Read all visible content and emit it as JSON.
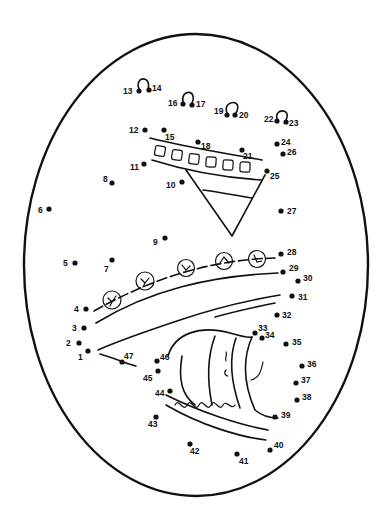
{
  "puzzle": {
    "type": "connect-the-dots",
    "subject": "decorated egg",
    "outline_color": "#111111",
    "background": "#ffffff",
    "total_dots": 47,
    "dots": [
      {
        "n": "1",
        "x": 88,
        "y": 351,
        "lx": 78,
        "ly": 360
      },
      {
        "n": "2",
        "x": 79,
        "y": 343,
        "lx": 66,
        "ly": 346
      },
      {
        "n": "3",
        "x": 84,
        "y": 328,
        "lx": 72,
        "ly": 331
      },
      {
        "n": "4",
        "x": 86,
        "y": 309,
        "lx": 74,
        "ly": 312
      },
      {
        "n": "5",
        "x": 75,
        "y": 263,
        "lx": 63,
        "ly": 266
      },
      {
        "n": "6",
        "x": 49,
        "y": 209,
        "lx": 38,
        "ly": 213
      },
      {
        "n": "7",
        "x": 112,
        "y": 260,
        "lx": 104,
        "ly": 272
      },
      {
        "n": "8",
        "x": 112,
        "y": 183,
        "lx": 103,
        "ly": 182
      },
      {
        "n": "9",
        "x": 165,
        "y": 238,
        "lx": 153,
        "ly": 245
      },
      {
        "n": "10",
        "x": 182,
        "y": 182,
        "lx": 166,
        "ly": 188
      },
      {
        "n": "11",
        "x": 144,
        "y": 164,
        "lx": 130,
        "ly": 170
      },
      {
        "n": "12",
        "x": 145,
        "y": 130,
        "lx": 129,
        "ly": 133
      },
      {
        "n": "13",
        "x": 139,
        "y": 91,
        "lx": 123,
        "ly": 94
      },
      {
        "n": "14",
        "x": 149,
        "y": 90,
        "lx": 152,
        "ly": 91
      },
      {
        "n": "15",
        "x": 164,
        "y": 130,
        "lx": 165,
        "ly": 140
      },
      {
        "n": "16",
        "x": 183,
        "y": 104,
        "lx": 168,
        "ly": 106
      },
      {
        "n": "17",
        "x": 192,
        "y": 105,
        "lx": 196,
        "ly": 107
      },
      {
        "n": "18",
        "x": 198,
        "y": 142,
        "lx": 201,
        "ly": 149
      },
      {
        "n": "19",
        "x": 227,
        "y": 115,
        "lx": 214,
        "ly": 114
      },
      {
        "n": "20",
        "x": 235,
        "y": 115,
        "lx": 239,
        "ly": 118
      },
      {
        "n": "21",
        "x": 242,
        "y": 150,
        "lx": 243,
        "ly": 159
      },
      {
        "n": "22",
        "x": 277,
        "y": 121,
        "lx": 264,
        "ly": 122
      },
      {
        "n": "23",
        "x": 286,
        "y": 122,
        "lx": 289,
        "ly": 126
      },
      {
        "n": "24",
        "x": 277,
        "y": 144,
        "lx": 281,
        "ly": 145
      },
      {
        "n": "25",
        "x": 267,
        "y": 171,
        "lx": 270,
        "ly": 179
      },
      {
        "n": "26",
        "x": 283,
        "y": 154,
        "lx": 287,
        "ly": 155
      },
      {
        "n": "27",
        "x": 281,
        "y": 211,
        "lx": 287,
        "ly": 214
      },
      {
        "n": "28",
        "x": 281,
        "y": 254,
        "lx": 287,
        "ly": 255
      },
      {
        "n": "29",
        "x": 283,
        "y": 272,
        "lx": 289,
        "ly": 271
      },
      {
        "n": "30",
        "x": 298,
        "y": 281,
        "lx": 303,
        "ly": 281
      },
      {
        "n": "31",
        "x": 292,
        "y": 296,
        "lx": 298,
        "ly": 300
      },
      {
        "n": "32",
        "x": 277,
        "y": 315,
        "lx": 282,
        "ly": 318
      },
      {
        "n": "33",
        "x": 255,
        "y": 333,
        "lx": 258,
        "ly": 331
      },
      {
        "n": "34",
        "x": 262,
        "y": 338,
        "lx": 265,
        "ly": 338
      },
      {
        "n": "35",
        "x": 286,
        "y": 344,
        "lx": 292,
        "ly": 345
      },
      {
        "n": "36",
        "x": 302,
        "y": 366,
        "lx": 307,
        "ly": 367
      },
      {
        "n": "37",
        "x": 296,
        "y": 383,
        "lx": 301,
        "ly": 383
      },
      {
        "n": "38",
        "x": 297,
        "y": 400,
        "lx": 302,
        "ly": 400
      },
      {
        "n": "39",
        "x": 275,
        "y": 417,
        "lx": 281,
        "ly": 418
      },
      {
        "n": "40",
        "x": 270,
        "y": 450,
        "lx": 274,
        "ly": 448
      },
      {
        "n": "41",
        "x": 237,
        "y": 454,
        "lx": 239,
        "ly": 464
      },
      {
        "n": "42",
        "x": 190,
        "y": 444,
        "lx": 190,
        "ly": 454
      },
      {
        "n": "43",
        "x": 156,
        "y": 417,
        "lx": 148,
        "ly": 427
      },
      {
        "n": "44",
        "x": 170,
        "y": 391,
        "lx": 155,
        "ly": 396
      },
      {
        "n": "45",
        "x": 158,
        "y": 371,
        "lx": 143,
        "ly": 381
      },
      {
        "n": "46",
        "x": 157,
        "y": 361,
        "lx": 160,
        "ly": 360
      },
      {
        "n": "47",
        "x": 122,
        "y": 362,
        "lx": 124,
        "ly": 359
      }
    ]
  }
}
